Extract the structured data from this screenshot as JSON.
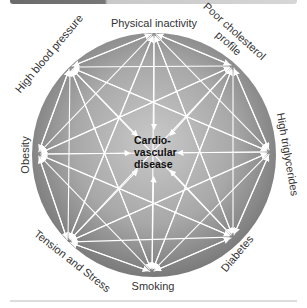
{
  "header": {
    "bar_colors": [
      "#6a6a6a",
      "#d6d6d6"
    ]
  },
  "diagram": {
    "center": {
      "lines": [
        "Cardio-",
        "vascular",
        "disease"
      ]
    },
    "nodes": [
      {
        "id": "physical-inactivity",
        "label": "Physical inactivity"
      },
      {
        "id": "poor-cholesterol",
        "label_lines": [
          "Poor cholesterol",
          "profile"
        ]
      },
      {
        "id": "high-triglycerides",
        "label": "High triglycerides"
      },
      {
        "id": "diabetes",
        "label": "Diabetes"
      },
      {
        "id": "smoking",
        "label": "Smoking"
      },
      {
        "id": "tension-stress",
        "label": "Tension and Stress"
      },
      {
        "id": "obesity",
        "label": "Obesity"
      },
      {
        "id": "high-blood-pressure",
        "label": "High blood pressure"
      }
    ],
    "colors": {
      "circle_light": "#c4c4c4",
      "circle_dark": "#7d7d7d",
      "arrow": "#ffffff"
    }
  }
}
